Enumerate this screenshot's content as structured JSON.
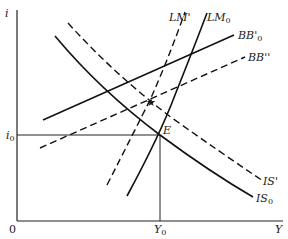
{
  "diagram": {
    "axes": {
      "y_label": "i",
      "x_label": "Y",
      "origin_label": "0"
    },
    "equilibrium": {
      "point_label": "E",
      "i_label": "i",
      "i_sub": "0",
      "y_label": "Y",
      "y_sub": "0"
    },
    "curves": [
      {
        "id": "IS0",
        "label": "IS",
        "sub": "0",
        "style": "solid"
      },
      {
        "id": "ISprime",
        "label": "IS'",
        "sub": "",
        "style": "dashed"
      },
      {
        "id": "LM0",
        "label": "LM",
        "sub": "0",
        "style": "solid"
      },
      {
        "id": "LMprime",
        "label": "LM'",
        "sub": "",
        "style": "dashed"
      },
      {
        "id": "BB0prime",
        "label": "BB'",
        "sub": "0",
        "style": "solid"
      },
      {
        "id": "BBdoubleprime",
        "label": "BB''",
        "sub": "",
        "style": "dashed"
      }
    ],
    "new_equilibrium_marker": "star"
  }
}
